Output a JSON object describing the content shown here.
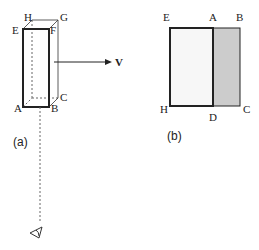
{
  "figure_a": {
    "caption": "(a)",
    "vertices": {
      "E": "E",
      "F": "F",
      "G": "G",
      "H": "H",
      "A": "A",
      "B": "B",
      "C": "C"
    },
    "velocity_label": "V",
    "observer_icon": "eye-icon"
  },
  "figure_b": {
    "caption": "(b)",
    "vertices": {
      "E": "E",
      "A": "A",
      "B": "B",
      "H": "H",
      "D": "D",
      "C": "C"
    },
    "shaded_color": "#cccccc",
    "unshaded_color": "#f7f7f7"
  },
  "colors": {
    "stroke": "#222222",
    "dashed": "#666666"
  }
}
